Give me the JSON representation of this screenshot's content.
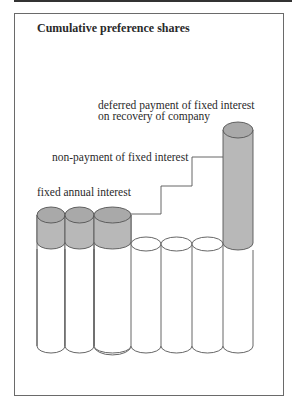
{
  "diagram": {
    "title": "Cumulative preference shares",
    "labels": {
      "deferred_line1": "deferred payment of fixed interest",
      "deferred_line2": "on recovery of company",
      "non_payment": "non-payment of fixed interest",
      "fixed_annual": "fixed annual interest"
    },
    "colors": {
      "shade": "#b8b8b8",
      "shade_top": "#a9a9a9",
      "stroke": "#555555",
      "frame": "#6a6a6a"
    },
    "columns": [
      {
        "index": 1,
        "state": "paid",
        "shaded": true
      },
      {
        "index": 2,
        "state": "paid",
        "shaded": true
      },
      {
        "index": 3,
        "state": "paid",
        "shaded": true
      },
      {
        "index": 4,
        "state": "unpaid",
        "shaded": false
      },
      {
        "index": 5,
        "state": "unpaid",
        "shaded": false
      },
      {
        "index": 6,
        "state": "unpaid",
        "shaded": false
      },
      {
        "index": 7,
        "state": "arrears paid",
        "shaded": true
      }
    ]
  }
}
